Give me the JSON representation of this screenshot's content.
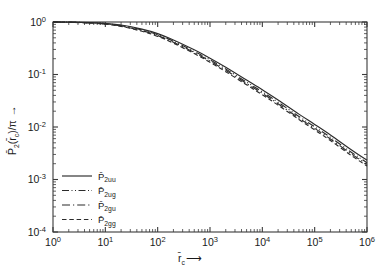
{
  "figure": {
    "background_color": "#ffffff",
    "line_color": "#2b2b2b",
    "axis_color": "#3a3a3a"
  },
  "chart_data": {
    "type": "line",
    "title": "",
    "xlabel": "r̄_c",
    "xlabel_parts": {
      "base": "r",
      "sub": "c",
      "arrow": "⟶"
    },
    "ylabel": "P̄2(r̄_c)/π",
    "ylabel_parts": {
      "base": "P",
      "sub": "2",
      "arg": "(r̄",
      "argsub": "c",
      "argend": ")/π",
      "arrow": "↑"
    },
    "xscale": "log",
    "yscale": "log",
    "xlim": [
      1,
      1000000
    ],
    "ylim": [
      0.0001,
      1
    ],
    "grid": false,
    "legend_position": "lower-left",
    "xticks": [
      1,
      10,
      100,
      1000,
      10000,
      100000,
      1000000
    ],
    "xtick_labels": [
      "10⁰",
      "10¹",
      "10²",
      "10³",
      "10⁴",
      "10⁵",
      "10⁶"
    ],
    "xtick_mantissa": [
      "10",
      "10",
      "10",
      "10",
      "10",
      "10",
      "10"
    ],
    "xtick_exponents": [
      "0",
      "1",
      "2",
      "3",
      "4",
      "5",
      "6"
    ],
    "yticks": [
      1,
      0.1,
      0.01,
      0.001,
      0.0001
    ],
    "ytick_mantissa": [
      "10",
      "10",
      "10",
      "10",
      "10"
    ],
    "ytick_exponents": [
      "0",
      "-1",
      "-2",
      "-3",
      "-4"
    ],
    "ytick_labels": [
      "10⁰",
      "10⁻¹",
      "10⁻²",
      "10⁻³",
      "10⁻⁴"
    ],
    "series": [
      {
        "name": "P̄2uu",
        "label_base": "P",
        "label_sub": "2uu",
        "linestyle": "solid",
        "dasharray": "",
        "x": [
          1,
          2,
          5,
          10,
          20,
          50,
          100,
          200,
          500,
          1000,
          2000,
          5000,
          10000,
          20000,
          50000,
          100000,
          200000,
          500000,
          1000000
        ],
        "y": [
          1.0,
          0.995,
          0.975,
          0.94,
          0.875,
          0.73,
          0.6,
          0.455,
          0.295,
          0.205,
          0.138,
          0.0785,
          0.0512,
          0.0328,
          0.0176,
          0.0112,
          0.00705,
          0.00368,
          0.00232
        ]
      },
      {
        "name": "P̄2ug",
        "label_base": "P",
        "label_sub": "2ug",
        "linestyle": "dash-dot-dot",
        "dasharray": "7,2.5,1,2.5,1,2.5",
        "x": [
          1,
          2,
          5,
          10,
          20,
          50,
          100,
          200,
          500,
          1000,
          2000,
          5000,
          10000,
          20000,
          50000,
          100000,
          200000,
          500000,
          1000000
        ],
        "y": [
          1.0,
          0.993,
          0.968,
          0.928,
          0.855,
          0.705,
          0.572,
          0.43,
          0.275,
          0.19,
          0.127,
          0.0718,
          0.0466,
          0.0297,
          0.0159,
          0.0101,
          0.00636,
          0.00331,
          0.00209
        ]
      },
      {
        "name": "P̄2gu",
        "label_base": "P",
        "label_sub": "2gu",
        "linestyle": "dash-dot",
        "dasharray": "8,3,1.2,3",
        "x": [
          1,
          2,
          5,
          10,
          20,
          50,
          100,
          200,
          500,
          1000,
          2000,
          5000,
          10000,
          20000,
          50000,
          100000,
          200000,
          500000,
          1000000
        ],
        "y": [
          1.0,
          0.991,
          0.962,
          0.918,
          0.84,
          0.685,
          0.552,
          0.412,
          0.262,
          0.18,
          0.12,
          0.0675,
          0.0437,
          0.0278,
          0.0148,
          0.00942,
          0.00592,
          0.00308,
          0.00194
        ]
      },
      {
        "name": "P̄2gg",
        "label_base": "P",
        "label_sub": "2gg",
        "linestyle": "dashed",
        "dasharray": "4.5,2.8",
        "x": [
          1,
          2,
          5,
          10,
          20,
          50,
          100,
          200,
          500,
          1000,
          2000,
          5000,
          10000,
          20000,
          50000,
          100000,
          200000,
          500000,
          1000000
        ],
        "y": [
          1.0,
          0.989,
          0.956,
          0.908,
          0.826,
          0.666,
          0.533,
          0.396,
          0.25,
          0.171,
          0.113,
          0.0636,
          0.0411,
          0.0261,
          0.0139,
          0.0088,
          0.00553,
          0.00287,
          0.00181
        ]
      }
    ],
    "legend_entries": [
      {
        "label_base": "P",
        "label_sub": "2uu",
        "linestyle": "solid"
      },
      {
        "label_base": "P",
        "label_sub": "2ug",
        "linestyle": "dash-dot-dot"
      },
      {
        "label_base": "P",
        "label_sub": "2gu",
        "linestyle": "dash-dot"
      },
      {
        "label_base": "P",
        "label_sub": "2gg",
        "linestyle": "dashed"
      }
    ]
  }
}
